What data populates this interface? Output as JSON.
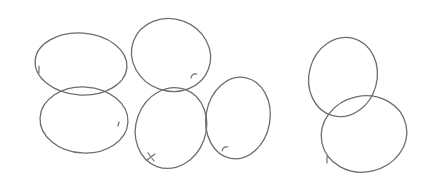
{
  "sketch": {
    "stroke_color": "#6e6e6e",
    "background": "#ffffff",
    "shapes": [
      {
        "name": "oval-top-left",
        "cx": 81,
        "cy": 64,
        "rx": 46,
        "ry": 31,
        "rot": 4,
        "mark": "tick",
        "mx": 39,
        "my": 70
      },
      {
        "name": "oval-bottom-left",
        "cx": 84,
        "cy": 120,
        "rx": 44,
        "ry": 33,
        "rot": 3,
        "mark": "dot",
        "mx": 119,
        "my": 124
      },
      {
        "name": "oval-top-middle",
        "cx": 171,
        "cy": 55,
        "rx": 40,
        "ry": 36,
        "rot": 20,
        "mark": "curl",
        "mx": 194,
        "my": 75
      },
      {
        "name": "oval-bottom-middle",
        "cx": 171,
        "cy": 128,
        "rx": 35,
        "ry": 41,
        "rot": 20,
        "mark": "cross",
        "mx": 151,
        "my": 157
      },
      {
        "name": "oval-right-middle",
        "cx": 238,
        "cy": 118,
        "rx": 32,
        "ry": 41,
        "rot": 10,
        "mark": "curl",
        "mx": 225,
        "my": 148
      },
      {
        "name": "oval-right-top",
        "cx": 343,
        "cy": 77,
        "rx": 34,
        "ry": 40,
        "rot": 15,
        "mark": "none",
        "mx": 0,
        "my": 0
      },
      {
        "name": "oval-right-bottom",
        "cx": 364,
        "cy": 134,
        "rx": 43,
        "ry": 38,
        "rot": -12,
        "mark": "tick",
        "mx": 327,
        "my": 160
      }
    ]
  }
}
